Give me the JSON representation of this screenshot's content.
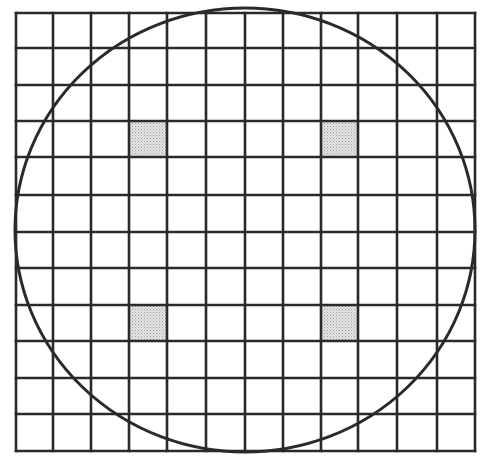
{
  "diagram": {
    "type": "circle-over-grid",
    "grid": {
      "columns": 12,
      "rows": 12,
      "x_lines": [
        16,
        53,
        91,
        129,
        167,
        206,
        245,
        283,
        321,
        358,
        397,
        437,
        475
      ],
      "y_lines": [
        13,
        48,
        85,
        121,
        157,
        195,
        232,
        268,
        305,
        341,
        378,
        414,
        451
      ],
      "line_color": "#2a2a2a",
      "line_width": 2.6
    },
    "circle": {
      "cx": 245,
      "cy": 230,
      "rx": 230,
      "ry": 222,
      "stroke_color": "#2a2a2a",
      "stroke_width": 3
    },
    "shaded_cells": [
      {
        "col": 3,
        "row": 3
      },
      {
        "col": 8,
        "row": 3
      },
      {
        "col": 3,
        "row": 8
      },
      {
        "col": 8,
        "row": 8
      }
    ],
    "shade_color": "#d6d6d6"
  }
}
